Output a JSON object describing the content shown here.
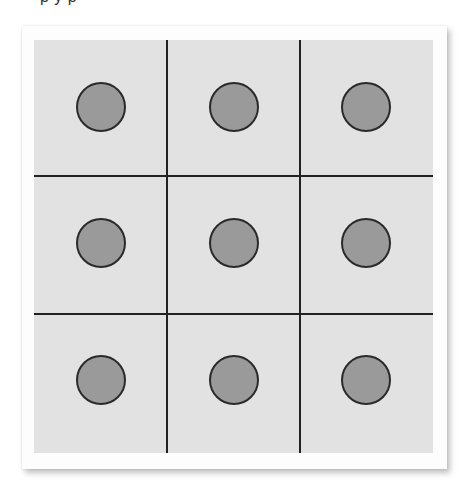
{
  "header": {
    "cropped_text": "p y                                   p"
  },
  "diagram": {
    "type": "grid-of-circles",
    "rows": 3,
    "cols": 3,
    "colors": {
      "cell_background": "#e2e2e2",
      "grid_lines": "#222222",
      "circle_fill": "#9a9a9a",
      "circle_stroke": "#2a2a2a",
      "card_background": "#fdfdfd"
    },
    "cells": [
      {
        "row": 1,
        "col": 1,
        "shape": "circle"
      },
      {
        "row": 1,
        "col": 2,
        "shape": "circle"
      },
      {
        "row": 1,
        "col": 3,
        "shape": "circle"
      },
      {
        "row": 2,
        "col": 1,
        "shape": "circle"
      },
      {
        "row": 2,
        "col": 2,
        "shape": "circle"
      },
      {
        "row": 2,
        "col": 3,
        "shape": "circle"
      },
      {
        "row": 3,
        "col": 1,
        "shape": "circle"
      },
      {
        "row": 3,
        "col": 2,
        "shape": "circle"
      },
      {
        "row": 3,
        "col": 3,
        "shape": "circle"
      }
    ]
  }
}
